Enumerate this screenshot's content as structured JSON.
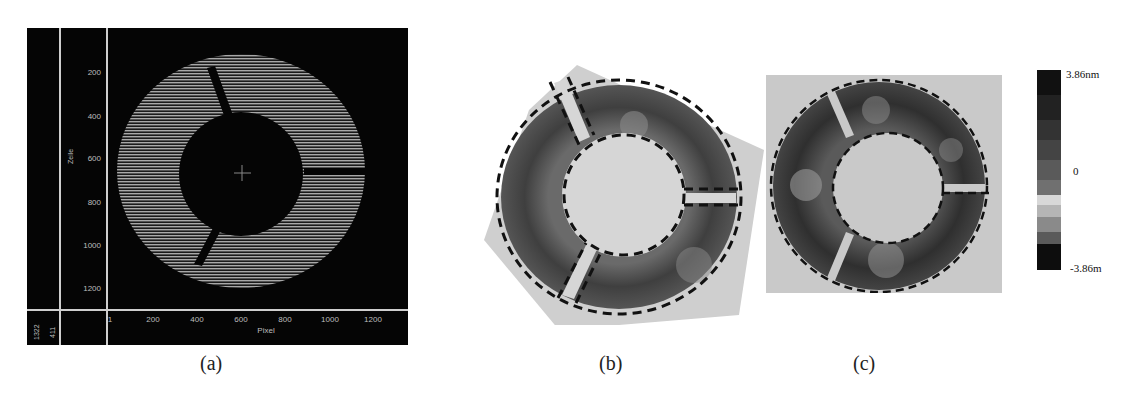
{
  "figure": {
    "panels": [
      {
        "id": "a",
        "caption": "(a)",
        "type": "interferogram-fringe-image",
        "y_axis": {
          "label": "Zeile",
          "ticks": [
            "200",
            "400",
            "600",
            "800",
            "1000",
            "1200"
          ]
        },
        "x_axis": {
          "label": "Pixel",
          "ticks": [
            "1",
            "200",
            "400",
            "600",
            "800",
            "1000",
            "1200"
          ]
        },
        "corner_values": [
          "1322",
          "411"
        ]
      },
      {
        "id": "b",
        "caption": "(b)",
        "type": "surface-map-rotated-with-dashed-segment-outlines"
      },
      {
        "id": "c",
        "caption": "(c)",
        "type": "surface-map-with-dashed-segment-outlines"
      }
    ],
    "colorbar": {
      "max_label": "3.86nm",
      "mid_label": "0",
      "min_label": "-3.86m"
    }
  }
}
